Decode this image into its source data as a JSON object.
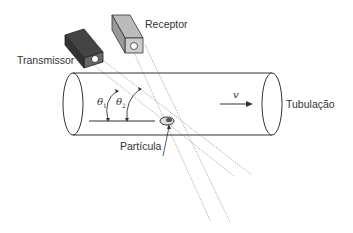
{
  "diagram": {
    "labels": {
      "transmitter": "Transmissor",
      "receiver": "Receptor",
      "pipe": "Tubulação",
      "particle": "Partícula",
      "velocity": "v",
      "theta1": "θ",
      "theta1_sub": "1",
      "theta2": "θ",
      "theta2_sub": "2"
    },
    "colors": {
      "stroke": "#333333",
      "transmitter_fill": "#555555",
      "receiver_fill": "#aaaaaa",
      "beam": "#777777"
    }
  }
}
